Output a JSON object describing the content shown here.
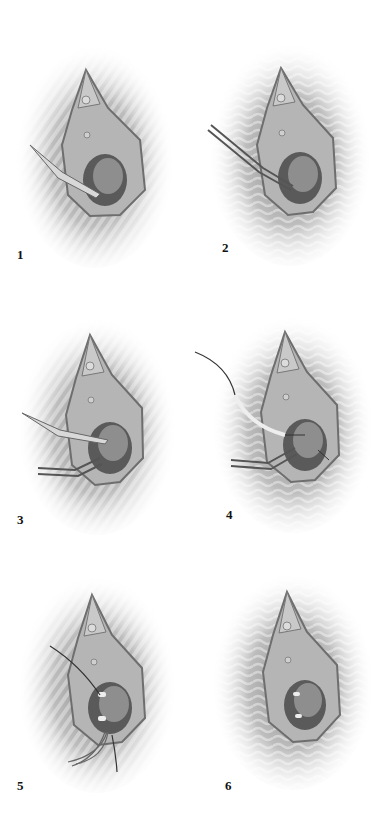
{
  "figure": {
    "type": "surgical-illustration-sequence",
    "panels": [
      {
        "number": "1",
        "instrument": "scalpel",
        "x": 0,
        "y": 0,
        "label_x": 17,
        "label_y": 247
      },
      {
        "number": "2",
        "instrument": "forceps",
        "x": 193,
        "y": 0,
        "label_x": 29,
        "label_y": 240
      },
      {
        "number": "3",
        "instrument": "scalpel-and-forceps",
        "x": 0,
        "y": 280,
        "label_x": 17,
        "label_y": 232
      },
      {
        "number": "4",
        "instrument": "suture-and-forceps",
        "x": 193,
        "y": 280,
        "label_x": 33,
        "label_y": 227
      },
      {
        "number": "5",
        "instrument": "sutures",
        "x": 0,
        "y": 550,
        "label_x": 17,
        "label_y": 228
      },
      {
        "number": "6",
        "instrument": "none",
        "x": 193,
        "y": 550,
        "label_x": 32,
        "label_y": 228
      }
    ],
    "colors": {
      "background": "#ffffff",
      "skin_shade": "#9a9a9a",
      "tissue": "#b5b5b5",
      "cavity": "#5a5a5a",
      "outline": "#6e6e6e",
      "label": "#111111"
    }
  }
}
